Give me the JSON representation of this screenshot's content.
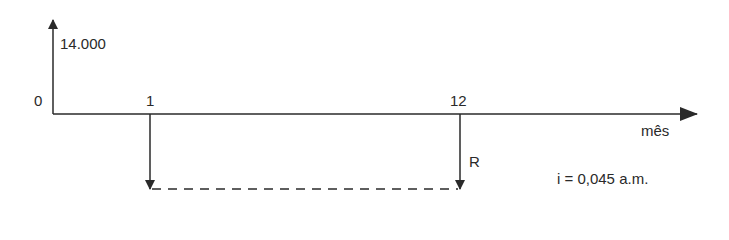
{
  "diagram": {
    "type": "cash-flow-timeline",
    "inflow": {
      "label": "14.000",
      "period": 0
    },
    "origin_label": "0",
    "period_labels": {
      "first": "1",
      "last": "12"
    },
    "axis_label": "mês",
    "payment_label": "R",
    "rate_label": "i = 0,045 a.m.",
    "colors": {
      "line": "#2a2a2a",
      "background": "#ffffff"
    }
  }
}
